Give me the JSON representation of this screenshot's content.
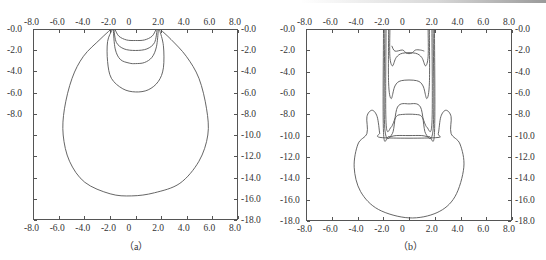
{
  "chart_data": [
    {
      "type": "line",
      "subtype": "contour",
      "caption": "（a）",
      "x_ticks": [
        "-8.0",
        "-6.0",
        "-4.0",
        "-2.0",
        "0",
        "2.0",
        "4.0",
        "6.0",
        "8.0"
      ],
      "x_tick_values": [
        -8,
        -6,
        -4,
        -2,
        0,
        2,
        4,
        6,
        8
      ],
      "y_ticks_left": [
        "-0.0",
        "-2.0",
        "-4.0",
        "-6.0",
        "-8.0"
      ],
      "y_ticks_left_values": [
        0,
        -2,
        -4,
        -6,
        -8
      ],
      "y_ticks_right": [
        "-0.0",
        "-2.0",
        "-4.0",
        "-6.0",
        "-8.0",
        "-10.0",
        "-12.0",
        "-14.0",
        "-16.0",
        "-18.0"
      ],
      "y_ticks_right_values": [
        0,
        -2,
        -4,
        -6,
        -8,
        -10,
        -12,
        -14,
        -16,
        -18
      ],
      "xlim": [
        -8,
        8
      ],
      "ylim": [
        -18,
        0
      ],
      "grid": false,
      "xlabel": "",
      "ylabel": "",
      "series": [
        {
          "name": "contour-1",
          "points": [
            [
              -1.6,
              0
            ],
            [
              -1.3,
              -0.6
            ],
            [
              -0.7,
              -0.95
            ],
            [
              0,
              -1.0
            ],
            [
              0.7,
              -0.95
            ],
            [
              1.3,
              -0.6
            ],
            [
              1.6,
              0
            ]
          ]
        },
        {
          "name": "contour-2",
          "points": [
            [
              -1.7,
              0
            ],
            [
              -1.5,
              -1.2
            ],
            [
              -0.9,
              -1.8
            ],
            [
              0,
              -1.95
            ],
            [
              0.9,
              -1.8
            ],
            [
              1.5,
              -1.2
            ],
            [
              1.7,
              0
            ]
          ]
        },
        {
          "name": "contour-3",
          "points": [
            [
              -1.75,
              0
            ],
            [
              -1.6,
              -1.8
            ],
            [
              -1.2,
              -2.8
            ],
            [
              -0.5,
              -3.15
            ],
            [
              0,
              -3.2
            ],
            [
              0.7,
              -3.1
            ],
            [
              1.3,
              -2.6
            ],
            [
              1.65,
              -1.6
            ],
            [
              1.8,
              0
            ]
          ]
        },
        {
          "name": "contour-4",
          "points": [
            [
              -1.85,
              0
            ],
            [
              -2.2,
              -1.1
            ],
            [
              -2.2,
              -3.0
            ],
            [
              -1.9,
              -4.6
            ],
            [
              -1.0,
              -5.6
            ],
            [
              0,
              -5.9
            ],
            [
              1.0,
              -5.7
            ],
            [
              1.8,
              -4.9
            ],
            [
              2.2,
              -3.6
            ],
            [
              2.2,
              -1.5
            ],
            [
              1.9,
              0
            ]
          ]
        },
        {
          "name": "contour-5",
          "points": [
            [
              -2.0,
              0
            ],
            [
              -2.8,
              -0.9
            ],
            [
              -4.1,
              -2.5
            ],
            [
              -5.0,
              -4.6
            ],
            [
              -5.6,
              -7.5
            ],
            [
              -5.7,
              -10.0
            ],
            [
              -5.2,
              -12.5
            ],
            [
              -4.0,
              -14.5
            ],
            [
              -2.0,
              -15.6
            ],
            [
              -0.3,
              -15.8
            ],
            [
              1.5,
              -15.5
            ],
            [
              3.5,
              -14.6
            ],
            [
              5.0,
              -12.5
            ],
            [
              5.7,
              -10.0
            ],
            [
              5.6,
              -7.5
            ],
            [
              5.0,
              -4.6
            ],
            [
              4.0,
              -2.5
            ],
            [
              2.8,
              -0.9
            ],
            [
              2.0,
              0
            ]
          ]
        }
      ]
    },
    {
      "type": "line",
      "subtype": "contour",
      "caption": "（b）",
      "x_ticks": [
        "-8.0",
        "-6.0",
        "-4.0",
        "-2.0",
        "0",
        "2.0",
        "4.0",
        "6.0",
        "8.0"
      ],
      "x_tick_values": [
        -8,
        -6,
        -4,
        -2,
        0,
        2,
        4,
        6,
        8
      ],
      "y_ticks_left": [
        "-0.0",
        "-2.0",
        "-4.0",
        "-6.0",
        "-8.0",
        "-10.0",
        "-12.0",
        "-14.0",
        "-16.0",
        "-18.0"
      ],
      "y_ticks_left_values": [
        0,
        -2,
        -4,
        -6,
        -8,
        -10,
        -12,
        -14,
        -16,
        -18
      ],
      "y_ticks_right": [
        "-0.0",
        "-2.0",
        "-4.0",
        "-6.0",
        "-8.0",
        "-10.0",
        "-12.0",
        "-14.0",
        "-16.0",
        "-18.0"
      ],
      "y_ticks_right_values": [
        0,
        -2,
        -4,
        -6,
        -8,
        -10,
        -12,
        -14,
        -16,
        -18
      ],
      "xlim": [
        -8,
        8
      ],
      "ylim": [
        -18,
        0
      ],
      "grid": false,
      "xlabel": "",
      "ylabel": "",
      "series": [
        {
          "name": "contour-top-1",
          "points": [
            [
              -1.35,
              -1.5
            ],
            [
              -1.1,
              -2.0
            ],
            [
              -0.5,
              -1.9
            ],
            [
              -0.2,
              -2.2
            ],
            [
              0.2,
              -2.2
            ],
            [
              0.5,
              -1.9
            ],
            [
              0.9,
              -1.9
            ],
            [
              1.2,
              -2.0
            ]
          ]
        },
        {
          "name": "contour-top-2",
          "points": [
            [
              -1.5,
              0
            ],
            [
              -1.5,
              -2.5
            ],
            [
              -1.3,
              -3.4
            ],
            [
              -1.0,
              -2.6
            ],
            [
              -0.5,
              -2.2
            ],
            [
              0.5,
              -2.2
            ],
            [
              1.0,
              -2.6
            ],
            [
              1.3,
              -3.4
            ],
            [
              1.5,
              -2.5
            ],
            [
              1.5,
              0
            ]
          ]
        },
        {
          "name": "contour-mid",
          "points": [
            [
              -1.6,
              0
            ],
            [
              -1.6,
              -5.0
            ],
            [
              -1.4,
              -6.5
            ],
            [
              -1.1,
              -5.3
            ],
            [
              -0.6,
              -4.8
            ],
            [
              0.6,
              -4.8
            ],
            [
              1.1,
              -5.3
            ],
            [
              1.4,
              -6.5
            ],
            [
              1.6,
              -5.0
            ],
            [
              1.6,
              0
            ]
          ]
        },
        {
          "name": "contour-inner-band",
          "points": [
            [
              -1.8,
              0
            ],
            [
              -1.8,
              -8.8
            ],
            [
              -1.4,
              -9.2
            ],
            [
              -1.0,
              -8.2
            ],
            [
              -0.5,
              -8.0
            ],
            [
              0.5,
              -8.0
            ],
            [
              1.0,
              -8.2
            ],
            [
              1.4,
              -9.2
            ],
            [
              1.8,
              -8.8
            ],
            [
              1.8,
              0
            ]
          ]
        },
        {
          "name": "contour-band-2",
          "points": [
            [
              -1.9,
              0
            ],
            [
              -1.9,
              -9.3
            ],
            [
              -1.3,
              -9.8
            ],
            [
              -0.9,
              -7.3
            ],
            [
              0,
              -7.0
            ],
            [
              0.9,
              -7.3
            ],
            [
              1.3,
              -9.8
            ],
            [
              1.9,
              -9.3
            ],
            [
              1.9,
              0
            ]
          ]
        },
        {
          "name": "contour-outer",
          "points": [
            [
              -2.0,
              0
            ],
            [
              -2.0,
              -9.7
            ],
            [
              -1.6,
              -10.1
            ],
            [
              -1.0,
              -10.0
            ],
            [
              0,
              -10.0
            ],
            [
              1.0,
              -10.0
            ],
            [
              1.6,
              -10.1
            ],
            [
              2.0,
              -9.7
            ],
            [
              2.0,
              0
            ]
          ]
        },
        {
          "name": "contour-bulb",
          "points": [
            [
              -2.3,
              -9.8
            ],
            [
              -2.5,
              -8.2
            ],
            [
              -2.9,
              -7.6
            ],
            [
              -3.3,
              -8.2
            ],
            [
              -3.3,
              -9.8
            ],
            [
              -4.0,
              -10.8
            ],
            [
              -4.3,
              -13.0
            ],
            [
              -3.8,
              -15.3
            ],
            [
              -2.4,
              -17.0
            ],
            [
              0,
              -17.8
            ],
            [
              2.2,
              -17.3
            ],
            [
              3.6,
              -15.8
            ],
            [
              4.3,
              -13.0
            ],
            [
              4.0,
              -10.8
            ],
            [
              3.3,
              -9.8
            ],
            [
              3.3,
              -8.2
            ],
            [
              2.9,
              -7.6
            ],
            [
              2.5,
              -8.2
            ],
            [
              2.3,
              -9.8
            ],
            [
              2.1,
              -10.2
            ],
            [
              -2.1,
              -10.2
            ],
            [
              -2.3,
              -9.8
            ]
          ]
        }
      ]
    }
  ]
}
